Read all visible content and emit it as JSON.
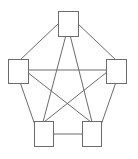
{
  "diagram": {
    "type": "complete-graph",
    "colors": {
      "stroke": "#6b6b6b",
      "fill": "#ffffff",
      "background": "#ffffff"
    },
    "nodes": [
      {
        "id": "top",
        "x": 58,
        "y": 11,
        "w": 20,
        "h": 25
      },
      {
        "id": "left",
        "x": 8,
        "y": 59,
        "w": 20,
        "h": 24
      },
      {
        "id": "right",
        "x": 106,
        "y": 59,
        "w": 20,
        "h": 24
      },
      {
        "id": "bottom-left",
        "x": 34,
        "y": 121,
        "w": 19,
        "h": 25
      },
      {
        "id": "bottom-right",
        "x": 82,
        "y": 121,
        "w": 19,
        "h": 25
      }
    ],
    "edges": [
      {
        "from": "top",
        "to": "left"
      },
      {
        "from": "top",
        "to": "right"
      },
      {
        "from": "top",
        "to": "bottom-left"
      },
      {
        "from": "top",
        "to": "bottom-right"
      },
      {
        "from": "left",
        "to": "right"
      },
      {
        "from": "left",
        "to": "bottom-left"
      },
      {
        "from": "left",
        "to": "bottom-right"
      },
      {
        "from": "right",
        "to": "bottom-left"
      },
      {
        "from": "right",
        "to": "bottom-right"
      },
      {
        "from": "bottom-left",
        "to": "bottom-right"
      }
    ]
  }
}
